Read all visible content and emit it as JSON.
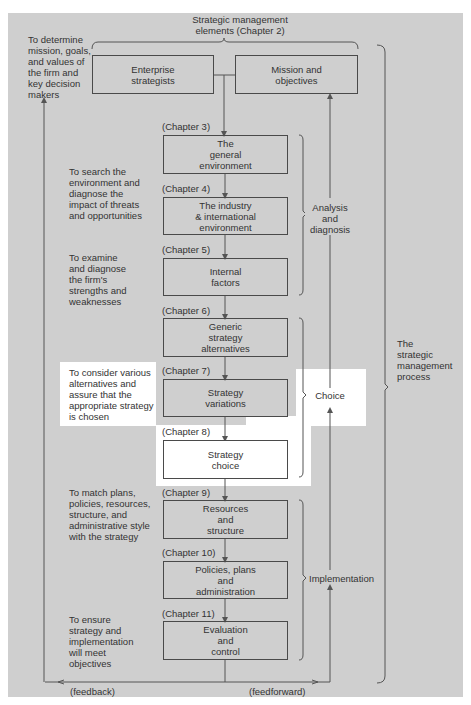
{
  "header": {
    "title": "Strategic management\nelements (Chapter 2)"
  },
  "top_boxes": [
    {
      "label": "Enterprise\nstrategists"
    },
    {
      "label": "Mission and\nobjectives"
    }
  ],
  "left_notes": [
    {
      "text": "To determine\nmission, goals,\nand values of\nthe firm and\nkey decision\nmakers"
    },
    {
      "text": "To search the\nenvironment and\ndiagnose the\nimpact of threats\nand opportunities"
    },
    {
      "text": "To examine\nand diagnose\nthe firm's\nstrengths and\nweaknesses"
    },
    {
      "text": "To consider various\nalternatives and\nassure that the\nappropriate strategy\nis chosen"
    },
    {
      "text": "To match plans,\npolicies, resources,\nstructure, and\nadministrative style\nwith the strategy"
    },
    {
      "text": "To ensure\nstrategy and\nimplementation\nwill meet\nobjectives"
    }
  ],
  "steps": [
    {
      "chapter": "(Chapter 3)",
      "label": "The\ngeneral\nenvironment"
    },
    {
      "chapter": "(Chapter 4)",
      "label": "The industry\n& international\nenvironment"
    },
    {
      "chapter": "(Chapter 5)",
      "label": "Internal\nfactors"
    },
    {
      "chapter": "(Chapter 6)",
      "label": "Generic\nstrategy\nalternatives"
    },
    {
      "chapter": "(Chapter 7)",
      "label": "Strategy\nvariations"
    },
    {
      "chapter": "(Chapter 8)",
      "label": "Strategy\nchoice"
    },
    {
      "chapter": "(Chapter 9)",
      "label": "Resources\nand\nstructure"
    },
    {
      "chapter": "(Chapter 10)",
      "label": "Policies, plans\nand\nadministration"
    },
    {
      "chapter": "(Chapter 11)",
      "label": "Evaluation\nand\ncontrol"
    }
  ],
  "phases": [
    {
      "label": "Analysis\nand\ndiagnosis"
    },
    {
      "label": "Choice"
    },
    {
      "label": "Implementation"
    }
  ],
  "process_label": "The\nstrategic\nmanagement\nprocess",
  "feedback_label": "(feedback)",
  "feedforward_label": "(feedforward)",
  "colors": {
    "background": "#cfcfcf",
    "highlight": "#ffffff",
    "line": "#4a4a4a"
  }
}
